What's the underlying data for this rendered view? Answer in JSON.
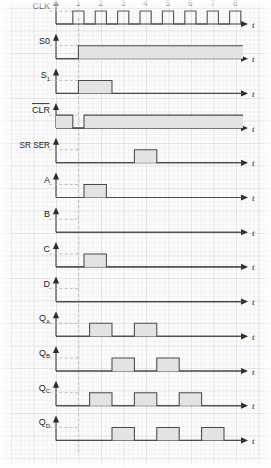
{
  "figure": {
    "type": "timing-diagram",
    "time_axis_label": "t",
    "clock_cycles": [
      "1",
      "2",
      "3",
      "4",
      "5",
      "6",
      "7",
      "8"
    ],
    "background": "#fbfbfb",
    "grid_color": "#9696a0",
    "wave_color": "#4a4a4a",
    "pulse_fill": "#e3e3e3",
    "axis_color": "#3b3b3b"
  },
  "signals": [
    {
      "id": "clk",
      "label": "CLK",
      "overline": false,
      "sublabel": "",
      "kind": "clock"
    },
    {
      "id": "s0",
      "label": "S0",
      "overline": false,
      "sublabel": "",
      "kind": "level"
    },
    {
      "id": "s1",
      "label": "S",
      "overline": false,
      "sublabel": "1",
      "kind": "level"
    },
    {
      "id": "clr",
      "label": "CLR",
      "overline": true,
      "sublabel": "",
      "kind": "level"
    },
    {
      "id": "srser",
      "label": "SR SER",
      "overline": false,
      "sublabel": "",
      "kind": "level"
    },
    {
      "id": "a",
      "label": "A",
      "overline": false,
      "sublabel": "",
      "kind": "level"
    },
    {
      "id": "b",
      "label": "B",
      "overline": false,
      "sublabel": "",
      "kind": "level"
    },
    {
      "id": "c",
      "label": "C",
      "overline": false,
      "sublabel": "",
      "kind": "level"
    },
    {
      "id": "d",
      "label": "D",
      "overline": false,
      "sublabel": "",
      "kind": "level"
    },
    {
      "id": "qa",
      "label": "Q",
      "overline": false,
      "sublabel": "A",
      "kind": "level"
    },
    {
      "id": "qb",
      "label": "Q",
      "overline": false,
      "sublabel": "B",
      "kind": "level"
    },
    {
      "id": "qc",
      "label": "Q",
      "overline": false,
      "sublabel": "C",
      "kind": "level"
    },
    {
      "id": "qd",
      "label": "Q",
      "overline": false,
      "sublabel": "D",
      "kind": "level"
    }
  ],
  "chart_data": {
    "type": "line",
    "xlabel": "t",
    "ylabel": "",
    "x_ticks": [
      1,
      2,
      3,
      4,
      5,
      6,
      7,
      8
    ],
    "x_tick_labels": [
      "1",
      "2",
      "3",
      "4",
      "5",
      "6",
      "7",
      "8"
    ],
    "xlim": [
      0,
      9
    ],
    "note": "Each signal is digital: value 0 = low, 1 = high. Intervals given in clock-cycle units along t.",
    "series": [
      {
        "name": "CLK",
        "levels": [
          {
            "from": 0.0,
            "to": 0.75,
            "v": 0
          },
          {
            "from": 0.75,
            "to": 1.25,
            "v": 1
          },
          {
            "from": 1.25,
            "to": 1.75,
            "v": 0
          },
          {
            "from": 1.75,
            "to": 2.25,
            "v": 1
          },
          {
            "from": 2.25,
            "to": 2.75,
            "v": 0
          },
          {
            "from": 2.75,
            "to": 3.25,
            "v": 1
          },
          {
            "from": 3.25,
            "to": 3.75,
            "v": 0
          },
          {
            "from": 3.75,
            "to": 4.25,
            "v": 1
          },
          {
            "from": 4.25,
            "to": 4.75,
            "v": 0
          },
          {
            "from": 4.75,
            "to": 5.25,
            "v": 1
          },
          {
            "from": 5.25,
            "to": 5.75,
            "v": 0
          },
          {
            "from": 5.75,
            "to": 6.25,
            "v": 1
          },
          {
            "from": 6.25,
            "to": 6.75,
            "v": 0
          },
          {
            "from": 6.75,
            "to": 7.25,
            "v": 1
          },
          {
            "from": 7.25,
            "to": 7.75,
            "v": 0
          },
          {
            "from": 7.75,
            "to": 8.25,
            "v": 1
          },
          {
            "from": 8.25,
            "to": 9.0,
            "v": 0
          }
        ]
      },
      {
        "name": "S0",
        "levels": [
          {
            "from": 0.0,
            "to": 1.0,
            "v": 0
          },
          {
            "from": 1.0,
            "to": 9.0,
            "v": 1
          }
        ]
      },
      {
        "name": "S1",
        "levels": [
          {
            "from": 0.0,
            "to": 1.0,
            "v": 0
          },
          {
            "from": 1.0,
            "to": 2.5,
            "v": 1
          },
          {
            "from": 2.5,
            "to": 9.0,
            "v": 0
          }
        ]
      },
      {
        "name": "CLR",
        "levels": [
          {
            "from": 0.0,
            "to": 0.75,
            "v": 1
          },
          {
            "from": 0.75,
            "to": 1.25,
            "v": 0
          },
          {
            "from": 1.25,
            "to": 9.0,
            "v": 1
          }
        ]
      },
      {
        "name": "SR SER",
        "levels": [
          {
            "from": 0.0,
            "to": 3.5,
            "v": 0
          },
          {
            "from": 3.5,
            "to": 4.5,
            "v": 1
          },
          {
            "from": 4.5,
            "to": 9.0,
            "v": 0
          }
        ]
      },
      {
        "name": "A",
        "levels": [
          {
            "from": 0.0,
            "to": 1.25,
            "v": 0
          },
          {
            "from": 1.25,
            "to": 2.25,
            "v": 1
          },
          {
            "from": 2.25,
            "to": 9.0,
            "v": 0
          }
        ]
      },
      {
        "name": "B",
        "levels": [
          {
            "from": 0.0,
            "to": 9.0,
            "v": 0
          }
        ]
      },
      {
        "name": "C",
        "levels": [
          {
            "from": 0.0,
            "to": 1.25,
            "v": 0
          },
          {
            "from": 1.25,
            "to": 2.25,
            "v": 1
          },
          {
            "from": 2.25,
            "to": 9.0,
            "v": 0
          }
        ]
      },
      {
        "name": "D",
        "levels": [
          {
            "from": 0.0,
            "to": 9.0,
            "v": 0
          }
        ]
      },
      {
        "name": "QA",
        "levels": [
          {
            "from": 0.0,
            "to": 1.5,
            "v": 0
          },
          {
            "from": 1.5,
            "to": 2.5,
            "v": 1
          },
          {
            "from": 2.5,
            "to": 3.5,
            "v": 0
          },
          {
            "from": 3.5,
            "to": 4.5,
            "v": 1
          },
          {
            "from": 4.5,
            "to": 9.0,
            "v": 0
          }
        ]
      },
      {
        "name": "QB",
        "levels": [
          {
            "from": 0.0,
            "to": 2.5,
            "v": 0
          },
          {
            "from": 2.5,
            "to": 3.5,
            "v": 1
          },
          {
            "from": 3.5,
            "to": 4.5,
            "v": 0
          },
          {
            "from": 4.5,
            "to": 5.5,
            "v": 1
          },
          {
            "from": 5.5,
            "to": 9.0,
            "v": 0
          }
        ]
      },
      {
        "name": "QC",
        "levels": [
          {
            "from": 0.0,
            "to": 1.5,
            "v": 0
          },
          {
            "from": 1.5,
            "to": 2.5,
            "v": 1
          },
          {
            "from": 2.5,
            "to": 3.5,
            "v": 0
          },
          {
            "from": 3.5,
            "to": 4.5,
            "v": 1
          },
          {
            "from": 4.5,
            "to": 5.5,
            "v": 0
          },
          {
            "from": 5.5,
            "to": 6.5,
            "v": 1
          },
          {
            "from": 6.5,
            "to": 9.0,
            "v": 0
          }
        ]
      },
      {
        "name": "QD",
        "levels": [
          {
            "from": 0.0,
            "to": 2.5,
            "v": 0
          },
          {
            "from": 2.5,
            "to": 3.5,
            "v": 1
          },
          {
            "from": 3.5,
            "to": 4.5,
            "v": 0
          },
          {
            "from": 4.5,
            "to": 5.5,
            "v": 1
          },
          {
            "from": 5.5,
            "to": 6.5,
            "v": 0
          },
          {
            "from": 6.5,
            "to": 7.5,
            "v": 1
          },
          {
            "from": 7.5,
            "to": 9.0,
            "v": 0
          }
        ]
      }
    ]
  }
}
